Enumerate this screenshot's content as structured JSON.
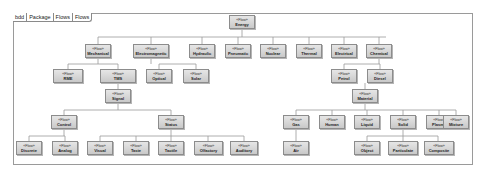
{
  "frame": {
    "tabs": [
      "bdd",
      "Package",
      "Flows",
      "Flows"
    ]
  },
  "stereotype": "«Flow»",
  "blocks": {
    "energy": "Energy",
    "mechanical": "Mechanical",
    "electromagnetic": "Electromagnetic",
    "hydraulic": "Hydraulic",
    "pneumatic": "Pneumatic",
    "nuclear": "Nuclear",
    "thermal": "Thermal",
    "electrical": "Electrical",
    "chemical": "Chemical",
    "rme": "RME",
    "tms": "TMS",
    "optical": "Optical",
    "solar": "Solar",
    "signal": "Signal",
    "control": "Control",
    "status": "Status",
    "discrete": "Discrete",
    "analog": "Analog",
    "visual": "Visual",
    "tactile": "Tactile",
    "taste": "Taste",
    "olfactory": "Olfactory",
    "auditory": "Auditory",
    "petrol": "Petrol",
    "diesel": "Diesel",
    "material": "Material",
    "gas": "Gas",
    "human": "Human",
    "liquid": "Liquid",
    "solid": "Solid",
    "plasma": "Plasma",
    "mixture": "Mixture",
    "air": "Air",
    "object": "Object",
    "particulate": "Particulate",
    "composite": "Composite"
  }
}
